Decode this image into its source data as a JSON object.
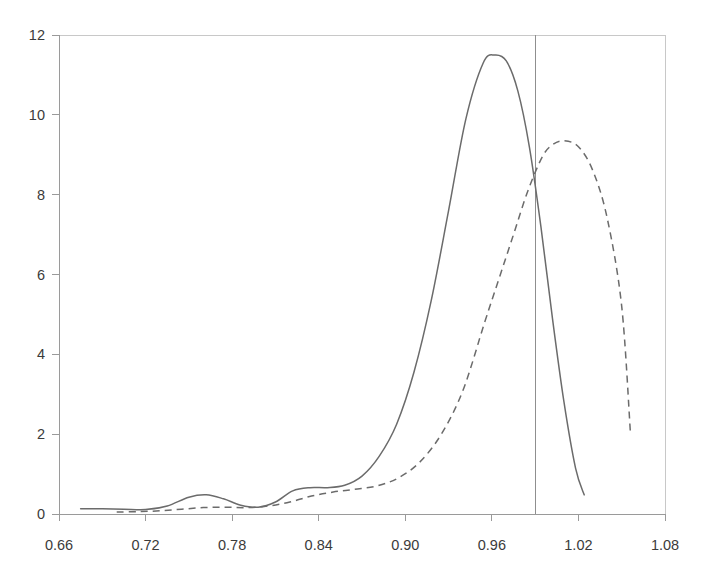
{
  "chart_data": {
    "type": "line",
    "title": "",
    "subtitle": "",
    "xlabel": "",
    "ylabel": "",
    "xlim": [
      0.66,
      1.08
    ],
    "ylim": [
      0,
      12
    ],
    "xticks": [
      0.66,
      0.72,
      0.78,
      0.84,
      0.9,
      0.96,
      1.02,
      1.08
    ],
    "xtick_labels": [
      "0.66",
      "0.72",
      "0.78",
      "0.84",
      "0.90",
      "0.96",
      "1.02",
      "1.08"
    ],
    "yticks": [
      0,
      2,
      4,
      6,
      8,
      10,
      12
    ],
    "ytick_labels": [
      "0",
      "2",
      "4",
      "6",
      "8",
      "10",
      "12"
    ],
    "grid": false,
    "legend": "none",
    "annotations": [
      {
        "name": "vertical-reference-line",
        "type": "vline",
        "x": 0.99,
        "color": "#8f8f8f"
      }
    ],
    "series": [
      {
        "name": "solid-density",
        "style": "solid",
        "color": "#6b6b6b",
        "x": [
          0.675,
          0.69,
          0.705,
          0.72,
          0.735,
          0.75,
          0.762,
          0.774,
          0.786,
          0.798,
          0.81,
          0.822,
          0.834,
          0.846,
          0.858,
          0.87,
          0.882,
          0.894,
          0.906,
          0.918,
          0.93,
          0.942,
          0.954,
          0.962,
          0.97,
          0.978,
          0.986,
          0.994,
          1.002,
          1.01,
          1.018,
          1.024
        ],
        "y": [
          0.13,
          0.13,
          0.12,
          0.11,
          0.2,
          0.42,
          0.48,
          0.38,
          0.22,
          0.17,
          0.3,
          0.58,
          0.66,
          0.66,
          0.72,
          0.95,
          1.45,
          2.25,
          3.55,
          5.35,
          7.6,
          9.9,
          11.3,
          11.5,
          11.35,
          10.6,
          9.2,
          7.2,
          4.9,
          2.8,
          1.15,
          0.48
        ]
      },
      {
        "name": "dashed-density",
        "style": "dashed",
        "color": "#6b6b6b",
        "x": [
          0.7,
          0.715,
          0.73,
          0.745,
          0.76,
          0.775,
          0.79,
          0.805,
          0.82,
          0.835,
          0.85,
          0.865,
          0.88,
          0.895,
          0.91,
          0.925,
          0.94,
          0.955,
          0.965,
          0.975,
          0.985,
          0.995,
          1.002,
          1.01,
          1.02,
          1.03,
          1.04,
          1.05,
          1.056
        ],
        "y": [
          0.05,
          0.06,
          0.08,
          0.12,
          0.16,
          0.17,
          0.16,
          0.2,
          0.3,
          0.45,
          0.55,
          0.62,
          0.7,
          0.9,
          1.3,
          2.0,
          3.1,
          4.8,
          5.9,
          7.0,
          8.1,
          8.95,
          9.25,
          9.35,
          9.2,
          8.6,
          7.4,
          5.2,
          2.05
        ]
      }
    ]
  },
  "geometry": {
    "plot_left": 59,
    "plot_right": 665,
    "plot_top": 35,
    "plot_bottom": 514
  }
}
